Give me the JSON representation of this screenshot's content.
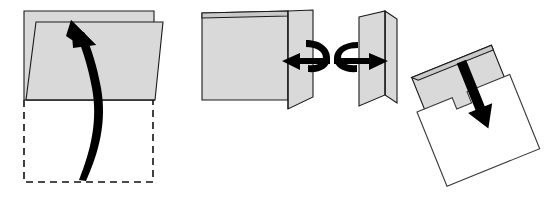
{
  "figure": {
    "kind": "folding-instruction-diagram",
    "background_color": "#ffffff",
    "width": 544,
    "height": 197,
    "paper_fill": "#d9d9d9",
    "paper_fill_shadow": "#c9c9c9",
    "paper_stroke": "#1a1a1a",
    "ghost_stroke": "#111111",
    "arrow_color": "#000000",
    "step_count": 4,
    "caption": "",
    "title": ""
  },
  "steps": [
    {
      "index": 1,
      "name": "fold-bottom-flap-up",
      "label": "",
      "description": "Bottom half of the sheet folds upward over the top half",
      "arrow": "curved-up-arrow",
      "arrow_direction": "up",
      "ghost_outline": "dashed-rectangle-original-bottom-half",
      "faces": [
        {
          "name": "back-sheet",
          "fill": "#d9d9d9"
        },
        {
          "name": "folded-front-flap",
          "fill": "#d9d9d9"
        }
      ]
    },
    {
      "index": 2,
      "name": "fold-right-panel-left",
      "label": "",
      "description": "Right side panel swings to the left across the sheet",
      "arrow": "curved-left-arrow",
      "arrow_direction": "left",
      "ghost_outline": "",
      "faces": [
        {
          "name": "main-panel",
          "fill": "#d9d9d9"
        },
        {
          "name": "swinging-right-panel",
          "fill": "#d9d9d9"
        }
      ]
    },
    {
      "index": 3,
      "name": "fold-panel-closed",
      "label": "",
      "description": "The V-folded sheet is pressed closed to the right",
      "arrow": "curved-right-arrow",
      "arrow_direction": "right",
      "ghost_outline": "",
      "faces": [
        {
          "name": "front-panel",
          "fill": "#d9d9d9"
        },
        {
          "name": "back-panel",
          "fill": "#d9d9d9"
        }
      ]
    },
    {
      "index": 4,
      "name": "insert-into-pocket",
      "label": "",
      "description": "Finished folded card is pushed down into the notched pocket",
      "arrow": "straight-down-arrow",
      "arrow_direction": "down",
      "ghost_outline": "",
      "rotation_degrees": -22,
      "faces": [
        {
          "name": "notched-gray-card",
          "fill": "#d9d9d9"
        },
        {
          "name": "white-pocket-front",
          "fill": "#ffffff"
        }
      ]
    }
  ]
}
